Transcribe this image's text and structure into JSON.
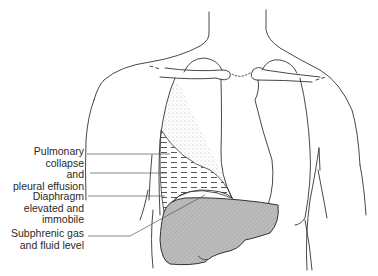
{
  "figure": {
    "colors": {
      "line": "#333333",
      "liver_fill": "#b9b9b9",
      "background": "#ffffff"
    }
  },
  "labels": [
    {
      "id": "pulmonary",
      "lines": [
        "Pulmonary",
        "collapse",
        "and",
        "pleural effusion"
      ]
    },
    {
      "id": "diaphragm",
      "lines": [
        "Diaphragm",
        "elevated and",
        "immobile"
      ]
    },
    {
      "id": "subphrenic",
      "lines": [
        "Subphrenic gas",
        "and fluid level"
      ]
    }
  ]
}
